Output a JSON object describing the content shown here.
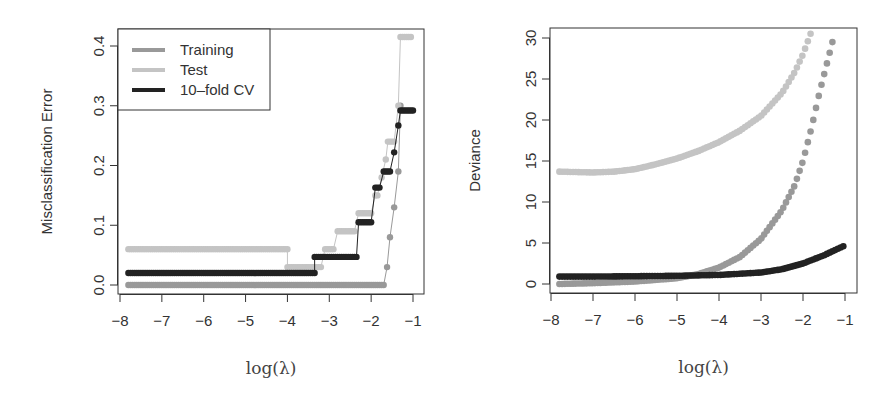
{
  "chart_data": [
    {
      "type": "scatter",
      "title": "",
      "xlabel": "log(λ)",
      "ylabel": "Misclassification Error",
      "xlim": [
        -8,
        -1
      ],
      "ylim": [
        0,
        0.4
      ],
      "xticks": [
        "-8",
        "-7",
        "-6",
        "-5",
        "-4",
        "-3",
        "-2",
        "-1"
      ],
      "yticks": [
        "0.0",
        "0.1",
        "0.2",
        "0.3",
        "0.4"
      ],
      "grid": false,
      "legend_position": "top-left",
      "legend": [
        "Training",
        "Test",
        "10-fold CV"
      ],
      "series": [
        {
          "name": "Training",
          "color": "#999999",
          "steps": [
            [
              -7.8,
              -1.7,
              0.0
            ],
            [
              -1.62,
              -1.62,
              0.03
            ],
            [
              -1.55,
              -1.55,
              0.08
            ],
            [
              -1.45,
              -1.45,
              0.13
            ],
            [
              -1.35,
              -1.35,
              0.19
            ],
            [
              -1.3,
              -1.3,
              0.3
            ]
          ]
        },
        {
          "name": "Test",
          "color": "#c4c4c4",
          "steps": [
            [
              -7.8,
              -4.0,
              0.06
            ],
            [
              -4.0,
              -3.2,
              0.03
            ],
            [
              -3.1,
              -2.9,
              0.06
            ],
            [
              -2.8,
              -2.4,
              0.09
            ],
            [
              -2.3,
              -2.0,
              0.12
            ],
            [
              -1.9,
              -1.85,
              0.15
            ],
            [
              -1.75,
              -1.75,
              0.18
            ],
            [
              -1.65,
              -1.65,
              0.21
            ],
            [
              -1.6,
              -1.45,
              0.24
            ],
            [
              -1.35,
              -1.35,
              0.3
            ],
            [
              -1.3,
              -1.05,
              0.415
            ]
          ]
        },
        {
          "name": "10-fold CV",
          "color": "#222222",
          "steps": [
            [
              -7.8,
              -3.35,
              0.02
            ],
            [
              -3.35,
              -2.35,
              0.047
            ],
            [
              -2.3,
              -2.0,
              0.105
            ],
            [
              -1.9,
              -1.8,
              0.163
            ],
            [
              -1.7,
              -1.55,
              0.19
            ],
            [
              -1.45,
              -1.45,
              0.222
            ],
            [
              -1.35,
              -1.35,
              0.267
            ],
            [
              -1.3,
              -1.0,
              0.292
            ]
          ]
        }
      ]
    },
    {
      "type": "scatter",
      "title": "",
      "xlabel": "log(λ)",
      "ylabel": "Deviance",
      "xlim": [
        -8,
        -1
      ],
      "ylim": [
        0,
        30
      ],
      "xticks": [
        "-8",
        "-7",
        "-6",
        "-5",
        "-4",
        "-3",
        "-2",
        "-1"
      ],
      "yticks": [
        "0",
        "5",
        "10",
        "15",
        "20",
        "25",
        "30"
      ],
      "grid": false,
      "series": [
        {
          "name": "Test",
          "color": "#c4c4c4",
          "x": [
            -7.8,
            -7.0,
            -6.5,
            -6.0,
            -5.5,
            -5.0,
            -4.5,
            -4.0,
            -3.5,
            -3.0,
            -2.5,
            -2.2,
            -2.0,
            -1.8
          ],
          "y": [
            13.7,
            13.6,
            13.7,
            14.0,
            14.6,
            15.3,
            16.2,
            17.3,
            18.7,
            20.5,
            23.3,
            25.8,
            28.0,
            30.8
          ]
        },
        {
          "name": "Training",
          "color": "#999999",
          "x": [
            -7.8,
            -7.0,
            -6.0,
            -5.0,
            -4.5,
            -4.0,
            -3.5,
            -3.0,
            -2.5,
            -2.2,
            -2.0,
            -1.8,
            -1.6,
            -1.45,
            -1.3
          ],
          "y": [
            0.0,
            0.1,
            0.3,
            0.7,
            1.2,
            2.0,
            3.3,
            5.5,
            9.0,
            12.0,
            15.0,
            19.0,
            23.5,
            26.5,
            29.5
          ]
        },
        {
          "name": "10-fold CV",
          "color": "#222222",
          "x": [
            -7.8,
            -7.0,
            -6.0,
            -5.0,
            -4.0,
            -3.0,
            -2.5,
            -2.0,
            -1.5,
            -1.0
          ],
          "y": [
            0.9,
            0.9,
            0.95,
            1.0,
            1.1,
            1.4,
            1.8,
            2.5,
            3.5,
            4.7
          ]
        }
      ]
    }
  ]
}
